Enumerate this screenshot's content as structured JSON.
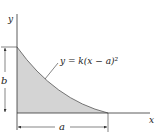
{
  "diagram": {
    "axes": {
      "x_label": "x",
      "y_label": "y"
    },
    "curve": {
      "equation": "y = k(x − a)²"
    },
    "dimensions": {
      "height_label": "b",
      "width_label": "a"
    },
    "colors": {
      "fill": "#d4d4d4",
      "line": "#333333",
      "text": "#222222"
    }
  }
}
